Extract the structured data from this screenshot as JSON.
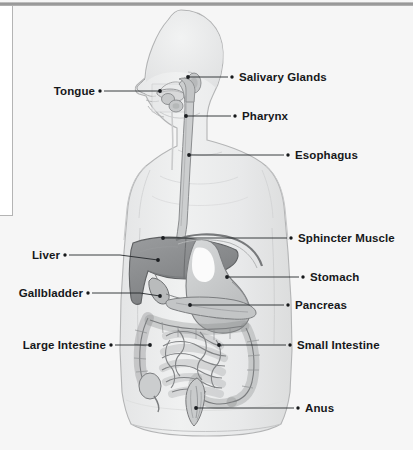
{
  "figure": {
    "kind": "anatomical-diagram",
    "background_color": "#f6f6f6",
    "ink_color": "#16181a",
    "body_fill": "#eceded",
    "body_stroke": "#b9babb",
    "liver_fill": "#8d8f91",
    "stomach_fill": "#c9cbcc",
    "intestine_fill": "#d7d8d9"
  },
  "labels": {
    "tongue": "Tongue",
    "salivary_glands": "Salivary Glands",
    "pharynx": "Pharynx",
    "esophagus": "Esophagus",
    "sphincter_muscle": "Sphincter Muscle",
    "liver": "Liver",
    "stomach": "Stomach",
    "gallbladder": "Gallbladder",
    "pancreas": "Pancreas",
    "large_intestine": "Large Intestine",
    "small_intestine": "Small Intestine",
    "anus": "Anus"
  },
  "callouts": [
    {
      "key": "tongue",
      "side": "left",
      "text_x": 55,
      "text_y": 86,
      "bullet_x": 100,
      "bullet_y": 91,
      "target_x": 160,
      "target_y": 91
    },
    {
      "key": "salivary_glands",
      "side": "right",
      "text_x": 239,
      "text_y": 72,
      "bullet_x": 232,
      "bullet_y": 77,
      "target_x": 188,
      "target_y": 77
    },
    {
      "key": "pharynx",
      "side": "right",
      "text_x": 242,
      "text_y": 111,
      "bullet_x": 235,
      "bullet_y": 116,
      "target_x": 186,
      "target_y": 116
    },
    {
      "key": "esophagus",
      "side": "right",
      "text_x": 295,
      "text_y": 150,
      "bullet_x": 288,
      "bullet_y": 155,
      "target_x": 189,
      "target_y": 155
    },
    {
      "key": "sphincter_muscle",
      "side": "right",
      "text_x": 298,
      "text_y": 233,
      "bullet_x": 291,
      "bullet_y": 238,
      "target_x": 163,
      "target_y": 238
    },
    {
      "key": "liver",
      "side": "left",
      "text_x": 31,
      "text_y": 250,
      "bullet_x": 65,
      "bullet_y": 255,
      "target_x": 158,
      "target_y": 260
    },
    {
      "key": "stomach",
      "side": "right",
      "text_x": 310,
      "text_y": 272,
      "bullet_x": 303,
      "bullet_y": 277,
      "target_x": 227,
      "target_y": 277
    },
    {
      "key": "gallbladder",
      "side": "left",
      "text_x": 18,
      "text_y": 288,
      "bullet_x": 88,
      "bullet_y": 293,
      "target_x": 160,
      "target_y": 296
    },
    {
      "key": "pancreas",
      "side": "right",
      "text_x": 295,
      "text_y": 300,
      "bullet_x": 288,
      "bullet_y": 305,
      "target_x": 190,
      "target_y": 305
    },
    {
      "key": "large_intestine",
      "side": "left",
      "text_x": 22,
      "text_y": 340,
      "bullet_x": 111,
      "bullet_y": 345,
      "target_x": 150,
      "target_y": 345
    },
    {
      "key": "small_intestine",
      "side": "right",
      "text_x": 297,
      "text_y": 340,
      "bullet_x": 290,
      "bullet_y": 345,
      "target_x": 219,
      "target_y": 345
    },
    {
      "key": "anus",
      "side": "right",
      "text_x": 305,
      "text_y": 403,
      "bullet_x": 298,
      "bullet_y": 408,
      "target_x": 196,
      "target_y": 408
    }
  ]
}
